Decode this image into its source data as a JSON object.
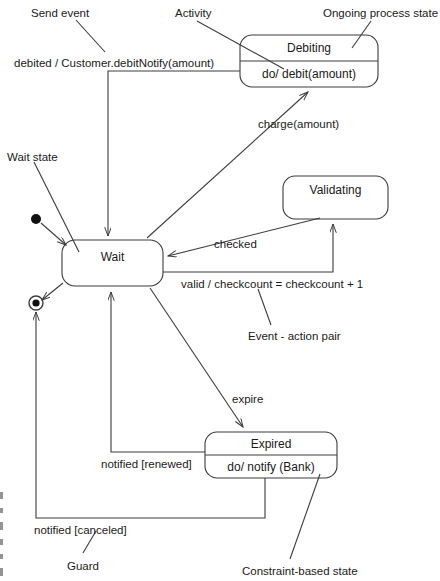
{
  "diagram": {
    "type": "uml-state-machine",
    "stroke_color": "#3c3c3c",
    "text_color": "#1a1a1a",
    "background_color": "#ffffff",
    "states": [
      {
        "id": "debiting",
        "name": "Debiting",
        "activity": "do/ debit(amount)",
        "compartments": 2,
        "x": 240,
        "y": 35,
        "w": 138,
        "h": 52
      },
      {
        "id": "validating",
        "name": "Validating",
        "activity": "",
        "compartments": 1,
        "x": 283,
        "y": 176,
        "w": 105,
        "h": 43
      },
      {
        "id": "wait",
        "name": "Wait",
        "activity": "",
        "compartments": 1,
        "x": 62,
        "y": 240,
        "w": 101,
        "h": 46
      },
      {
        "id": "expired",
        "name": "Expired",
        "activity": "do/ notify (Bank)",
        "compartments": 2,
        "x": 205,
        "y": 432,
        "w": 132,
        "h": 46
      }
    ],
    "pseudostates": [
      {
        "id": "initial",
        "kind": "initial-state",
        "cx": 36,
        "cy": 219,
        "r": 5
      },
      {
        "id": "final",
        "kind": "final-state",
        "cx": 36,
        "cy": 303,
        "r": 7
      }
    ],
    "transition_labels": [
      {
        "id": "debited",
        "text": "debited / Customer.debitNotify(amount)",
        "x": 14,
        "y": 58
      },
      {
        "id": "charge",
        "text": "charge(amount)",
        "x": 258,
        "y": 119
      },
      {
        "id": "checked",
        "text": "checked",
        "x": 214,
        "y": 239
      },
      {
        "id": "valid",
        "text": "valid / checkcount = checkcount + 1",
        "x": 181,
        "y": 279
      },
      {
        "id": "expire",
        "text": "expire",
        "x": 232,
        "y": 394
      },
      {
        "id": "notified-renewed",
        "text": "notified [renewed]",
        "x": 101,
        "y": 459
      },
      {
        "id": "notified-canceled",
        "text": "notified [canceled]",
        "x": 34,
        "y": 525
      }
    ],
    "annotations": [
      {
        "id": "send-event",
        "text": "Send event",
        "x": 31,
        "y": 8
      },
      {
        "id": "activity",
        "text": "Activity",
        "x": 175,
        "y": 8
      },
      {
        "id": "ongoing-process-state",
        "text": "Ongoing process state",
        "x": 323,
        "y": 8
      },
      {
        "id": "wait-state",
        "text": "Wait state",
        "x": 7,
        "y": 152
      },
      {
        "id": "event-action-pair",
        "text": "Event - action pair",
        "x": 248,
        "y": 331
      },
      {
        "id": "guard",
        "text": "Guard",
        "x": 67,
        "y": 561
      },
      {
        "id": "constraint-based-state",
        "text": "Constraint-based state",
        "x": 242,
        "y": 566
      }
    ]
  }
}
